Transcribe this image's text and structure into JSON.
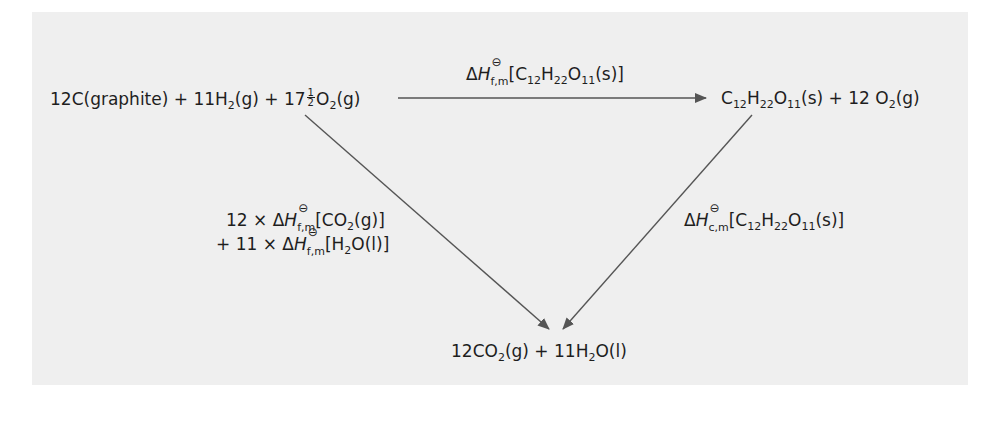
{
  "diagram": {
    "type": "thermochemical-cycle",
    "title": "",
    "nodes": {
      "reactants": {
        "parts": [
          {
            "text": "12C(graphite) + 11H"
          },
          {
            "sub": "2"
          },
          {
            "text": "(g) + 17"
          },
          {
            "frac": [
              "1",
              "2"
            ]
          },
          {
            "text": "O"
          },
          {
            "sub": "2"
          },
          {
            "text": "(g)"
          }
        ],
        "plain": "12C(graphite) + 11H2(g) + 17 1/2 O2(g)"
      },
      "sucrose": {
        "plain": "C12H22O11(s) + 12 O2(g)"
      },
      "products": {
        "plain": "12CO2(g) + 11H2O(l)"
      }
    },
    "edges": [
      {
        "from": "reactants",
        "to": "sucrose",
        "label": "ΔH°f,m[C12H22O11(s)]",
        "label_parts": {
          "delta": "Δ",
          "H": "H",
          "sub": "f,m",
          "sup": "⊖",
          "species": "[C12H22O11(s)]"
        }
      },
      {
        "from": "reactants",
        "to": "products",
        "label_line1": "12 × ΔH°f,m[CO2(g)]",
        "label_line2": "+ 11 × ΔH°f,m[H2O(l)]",
        "line1_parts": {
          "prefix": "12 × ",
          "sub": "f,m",
          "sup": "⊖",
          "species_a": "[CO",
          "species_sub": "2",
          "species_b": "(g)]"
        },
        "line2_parts": {
          "prefix": "+ 11 × ",
          "sub": "f,m",
          "sup": "⊖",
          "species_a": "[H",
          "species_sub": "2",
          "species_b": "O(l)]"
        }
      },
      {
        "from": "sucrose",
        "to": "products",
        "label": "ΔH°c,m[C12H22O11(s)]",
        "label_parts": {
          "sub": "c,m",
          "sup": "⊖"
        }
      }
    ],
    "colors": {
      "panel_bg": "#efefef",
      "line": "#555555",
      "text": "#1e1e1e"
    }
  },
  "text": {
    "r1": "12C(graphite) + 11H",
    "r2": "2",
    "r3": "(g) + 17",
    "r_fnum": "1",
    "r_fden": "2",
    "r4": "O",
    "r5": "2",
    "r6": "(g)",
    "s_C": "C",
    "s_12": "12",
    "s_H": "H",
    "s_22": "22",
    "s_O": "O",
    "s_11": "11",
    "s_rest": "(s) + 12 O",
    "s_2": "2",
    "s_end": "(g)",
    "p1": "12CO",
    "p2": "2",
    "p3": "(g) + 11H",
    "p4": "2",
    "p5": "O(l)",
    "delta": "Δ",
    "H": "H",
    "std": "⊖",
    "fm": "f,m",
    "cm": "c,m",
    "top_br": "[C",
    "top_12": "12",
    "top_H": "H",
    "top_22": "22",
    "top_O": "O",
    "top_11": "11",
    "top_end": "(s)]",
    "l1_pre": "12 × ",
    "l1_a": "[CO",
    "l1_sub": "2",
    "l1_b": "(g)]",
    "l2_pre": "+ 11 × ",
    "l2_a": "[H",
    "l2_sub": "2",
    "l2_b": "O(l)]"
  }
}
